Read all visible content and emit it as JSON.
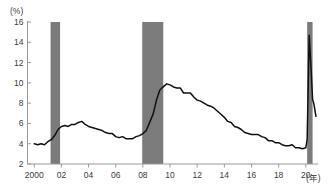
{
  "chart_data": {
    "type": "line",
    "title": "",
    "subtitle": "",
    "xlabel": "(年)",
    "ylabel": "(%)",
    "unit_label": "(%)",
    "xaxis_unit_label": "(年)",
    "grid": false,
    "legend": null,
    "xlim": [
      1999.5,
      2020.9
    ],
    "ylim": [
      2,
      16
    ],
    "yticks": [
      2,
      4,
      6,
      8,
      10,
      12,
      14,
      16
    ],
    "ytick_labels": [
      "2",
      "4",
      "6",
      "8",
      "10",
      "12",
      "14",
      "16"
    ],
    "xticks": [
      2000,
      2002,
      2004,
      2006,
      2008,
      2010,
      2012,
      2014,
      2016,
      2018,
      2020
    ],
    "xtick_labels": [
      "2000",
      "02",
      "04",
      "06",
      "08",
      "10",
      "12",
      "14",
      "16",
      "18",
      "20"
    ],
    "line_color": "#101010",
    "band_color": "#7b7b7b",
    "axis_color": "#9a9a9a",
    "shaded_regions": [
      {
        "name": "recession-2001",
        "start": 2001.2,
        "end": 2001.9
      },
      {
        "name": "recession-2008-2009",
        "start": 2007.95,
        "end": 2009.5
      },
      {
        "name": "recession-2020",
        "start": 2020.1,
        "end": 2020.5
      }
    ],
    "series": [
      {
        "name": "unemployment-rate",
        "x": [
          2000.0,
          2000.25,
          2000.5,
          2000.75,
          2001.0,
          2001.25,
          2001.5,
          2001.75,
          2002.0,
          2002.25,
          2002.5,
          2002.75,
          2003.0,
          2003.25,
          2003.5,
          2003.75,
          2004.0,
          2004.25,
          2004.5,
          2004.75,
          2005.0,
          2005.25,
          2005.5,
          2005.75,
          2006.0,
          2006.25,
          2006.5,
          2006.75,
          2007.0,
          2007.25,
          2007.5,
          2007.75,
          2008.0,
          2008.25,
          2008.5,
          2008.75,
          2009.0,
          2009.25,
          2009.5,
          2009.75,
          2010.0,
          2010.25,
          2010.5,
          2010.75,
          2011.0,
          2011.25,
          2011.5,
          2011.75,
          2012.0,
          2012.25,
          2012.5,
          2012.75,
          2013.0,
          2013.25,
          2013.5,
          2013.75,
          2014.0,
          2014.25,
          2014.5,
          2014.75,
          2015.0,
          2015.25,
          2015.5,
          2015.75,
          2016.0,
          2016.25,
          2016.5,
          2016.75,
          2017.0,
          2017.25,
          2017.5,
          2017.75,
          2018.0,
          2018.25,
          2018.5,
          2018.75,
          2019.0,
          2019.25,
          2019.5,
          2019.75,
          2020.0,
          2020.1,
          2020.25,
          2020.4,
          2020.5,
          2020.6,
          2020.75
        ],
        "values": [
          4.0,
          3.9,
          4.0,
          3.9,
          4.2,
          4.4,
          4.8,
          5.4,
          5.7,
          5.8,
          5.7,
          5.9,
          5.9,
          6.1,
          6.2,
          5.9,
          5.7,
          5.6,
          5.5,
          5.4,
          5.3,
          5.1,
          5.0,
          5.0,
          4.7,
          4.6,
          4.7,
          4.5,
          4.5,
          4.5,
          4.7,
          4.8,
          5.0,
          5.3,
          6.1,
          6.9,
          8.3,
          9.3,
          9.6,
          9.9,
          9.8,
          9.6,
          9.5,
          9.5,
          9.0,
          9.0,
          9.0,
          8.6,
          8.3,
          8.2,
          8.0,
          7.8,
          7.7,
          7.5,
          7.2,
          6.9,
          6.6,
          6.2,
          6.1,
          5.7,
          5.6,
          5.4,
          5.1,
          5.0,
          4.9,
          4.9,
          4.9,
          4.7,
          4.6,
          4.3,
          4.3,
          4.1,
          4.1,
          3.9,
          3.8,
          3.8,
          3.9,
          3.6,
          3.6,
          3.5,
          3.6,
          4.4,
          14.7,
          11.1,
          8.4,
          7.9,
          6.7
        ]
      }
    ],
    "annotations": [
      {
        "name": "covid-spike-peak",
        "x": 2020.25,
        "value": 14.7
      },
      {
        "name": "great-recession-peak",
        "x": 2009.75,
        "value": 9.9
      },
      {
        "name": "dotcom-peak",
        "x": 2003.5,
        "value": 6.2
      },
      {
        "name": "prerecession-trough",
        "x": 2019.75,
        "value": 3.5
      }
    ]
  }
}
